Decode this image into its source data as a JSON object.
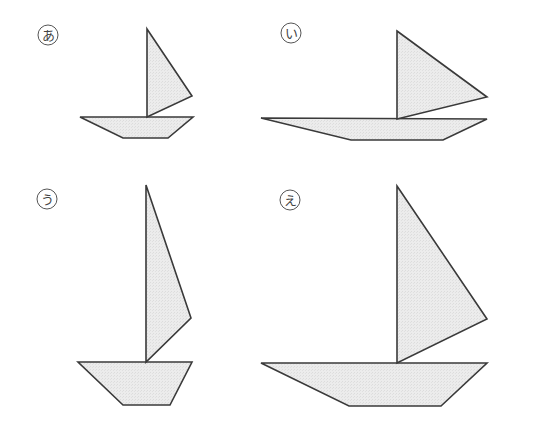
{
  "figure": {
    "colors": {
      "fill": "#e8e8e8",
      "stroke": "#3a3a3a",
      "label": "#444444"
    },
    "boats": [
      {
        "label": "あ",
        "label_pos": [
          48,
          35
        ],
        "sail": [
          [
            147,
            29
          ],
          [
            192,
            96
          ],
          [
            147,
            117
          ]
        ],
        "hull": [
          [
            80,
            117
          ],
          [
            193,
            117
          ],
          [
            168,
            138
          ],
          [
            123,
            138
          ]
        ]
      },
      {
        "label": "い",
        "label_pos": [
          291,
          33
        ],
        "sail": [
          [
            397,
            31
          ],
          [
            487,
            97
          ],
          [
            397,
            119
          ]
        ],
        "hull": [
          [
            261,
            118
          ],
          [
            487,
            119
          ],
          [
            443,
            140
          ],
          [
            351,
            140
          ]
        ]
      },
      {
        "label": "う",
        "label_pos": [
          47,
          199
        ],
        "sail": [
          [
            146,
            185
          ],
          [
            191,
            318
          ],
          [
            146,
            362
          ]
        ],
        "hull": [
          [
            78,
            362
          ],
          [
            192,
            362
          ],
          [
            170,
            405
          ],
          [
            123,
            405
          ]
        ]
      },
      {
        "label": "え",
        "label_pos": [
          290,
          200
        ],
        "sail": [
          [
            397,
            186
          ],
          [
            487,
            319
          ],
          [
            397,
            363
          ]
        ],
        "hull": [
          [
            261,
            363
          ],
          [
            487,
            363
          ],
          [
            441,
            406
          ],
          [
            349,
            406
          ]
        ]
      }
    ]
  }
}
